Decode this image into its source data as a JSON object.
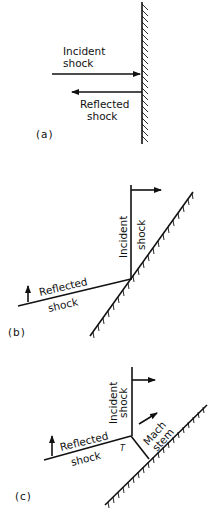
{
  "figure": {
    "panels": [
      {
        "id": "a",
        "tag": "(a)",
        "incident_label": [
          "Incident",
          "shock"
        ],
        "reflected_label": [
          "Reflected",
          "shock"
        ]
      },
      {
        "id": "b",
        "tag": "(b)",
        "incident_label": "Incident",
        "incident_label2": "shock",
        "reflected_label": "Reflected",
        "reflected_label2": "shock"
      },
      {
        "id": "c",
        "tag": "(c)",
        "incident_label": "Incident",
        "incident_label2": "shock",
        "reflected_label": "Reflected",
        "reflected_label2": "shock",
        "mach_label": "Mach",
        "mach_label2": "stem",
        "triple_point_label": "T"
      }
    ],
    "colors": {
      "ink": "#111111",
      "background": "#ffffff"
    }
  }
}
